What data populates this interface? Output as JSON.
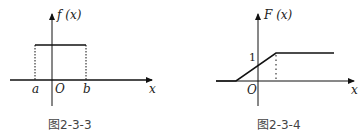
{
  "figures": [
    {
      "caption": "图2-3-3",
      "y_label": "f (x)",
      "x_label": "x",
      "origin_label": "O",
      "a_label": "a",
      "b_label": "b",
      "description": "Uniform density: constant between a and b, zero elsewhere"
    },
    {
      "caption": "图2-3-4",
      "y_label": "F (x)",
      "x_label": "x",
      "origin_label": "O",
      "one_label": "1",
      "description": "Uniform CDF: 0 before a, linear rise to 1 at b, constant 1 after"
    }
  ],
  "colors": {
    "line": "#111111",
    "text": "#222222",
    "caption": "#444444",
    "background": "#ffffff"
  }
}
